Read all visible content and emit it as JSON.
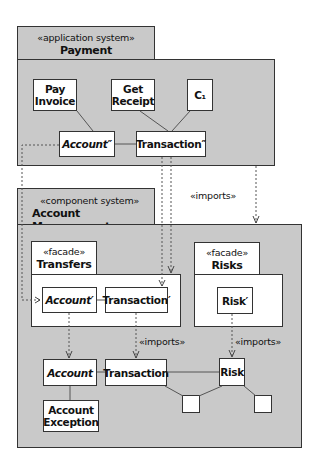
{
  "payment_package": {
    "stereotype": "«application system»",
    "name": "Payment",
    "classes": {
      "pay_invoice": "Pay Invoice",
      "get_receipt": "Get Receipt",
      "c1": "C₁",
      "account": "Account″",
      "transaction": "Transaction″"
    }
  },
  "imports_label_top": "«imports»",
  "account_management_package": {
    "stereotype": "«component system»",
    "name": "Account Management",
    "transfers_facade": {
      "stereotype": "«facade»",
      "name": "Transfers",
      "classes": {
        "account": "Account′",
        "transaction": "Transaction′"
      }
    },
    "risks_facade": {
      "stereotype": "«facade»",
      "name": "Risks",
      "classes": {
        "risk": "Risk′"
      }
    },
    "imports_label_transaction": "«imports»",
    "imports_label_risk": "«imports»",
    "classes": {
      "account": "Account",
      "account_exception": "Account Exception",
      "transaction": "Transaction",
      "risk": "Risk"
    }
  },
  "colors": {
    "package_fill": "#c9c9c9",
    "class_fill": "#ffffff",
    "stroke": "#333333"
  }
}
